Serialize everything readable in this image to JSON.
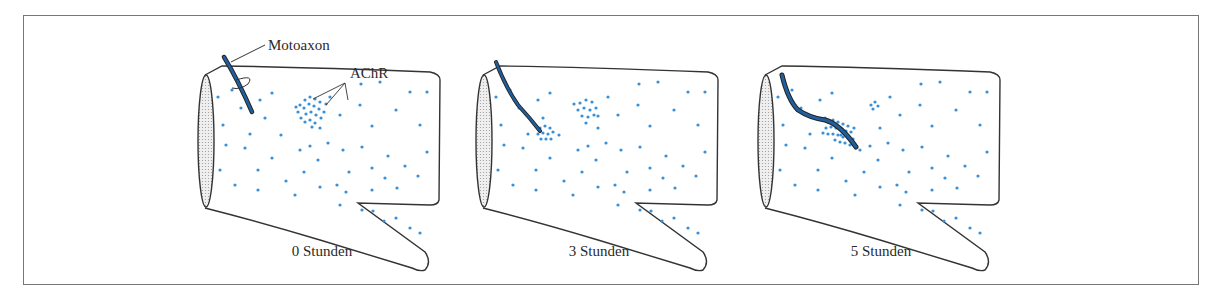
{
  "figure": {
    "labels": {
      "axon": "Motoaxon",
      "receptor": "AChR"
    },
    "panels": [
      {
        "id": "p0",
        "caption": "0 Stunden",
        "offset_x": 0
      },
      {
        "id": "p3",
        "caption": "3 Stunden",
        "offset_x": 278
      },
      {
        "id": "p5",
        "caption": "5 Stunden",
        "offset_x": 560
      }
    ],
    "colors": {
      "dot": "#3a8fd6",
      "axon": "#1f5f9e",
      "outline": "#333333",
      "frame": "#777777",
      "end_fill": "#dcdcdc"
    }
  }
}
